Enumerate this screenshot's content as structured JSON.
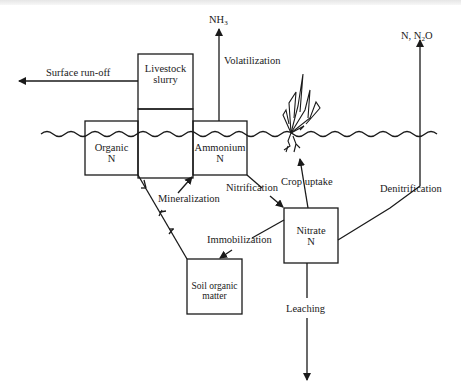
{
  "diagram": {
    "type": "nitrogen-cycle-flow",
    "nodes": {
      "livestock_slurry": {
        "line1": "Livestock",
        "line2": "slurry"
      },
      "organic_n": {
        "line1": "Organic",
        "line2": "N"
      },
      "ammonium_n": {
        "line1": "Ammonium",
        "line2": "N"
      },
      "nitrate_n": {
        "line1": "Nitrate",
        "line2": "N"
      },
      "soil_organic_matter": {
        "line1": "Soil organic",
        "line2": "matter"
      }
    },
    "outputs": {
      "nh3": {
        "base": "NH",
        "sub": "3"
      },
      "n_n2o": {
        "prefix": "N, N",
        "sub": "2",
        "suffix": "O"
      }
    },
    "processes": {
      "surface_runoff": "Surface run-off",
      "volatilization": "Volatilization",
      "mineralization": "Mineralization",
      "nitrification": "Nitrification",
      "crop_uptake": "Crop uptake",
      "denitrification": "Denitrification",
      "immobilization": "Immobilization",
      "leaching": "Leaching"
    },
    "edges": [
      {
        "from": "livestock_slurry",
        "to": "surface_runoff",
        "label": "Surface run-off"
      },
      {
        "from": "ammonium_n",
        "to": "nh3",
        "label": "Volatilization"
      },
      {
        "from": "organic_n",
        "to": "soil_organic_matter",
        "label": ""
      },
      {
        "from": "soil_organic_matter",
        "to": "ammonium_n",
        "label": "Mineralization"
      },
      {
        "from": "ammonium_n",
        "to": "nitrate_n",
        "label": "Nitrification"
      },
      {
        "from": "nitrate_n",
        "to": "crop",
        "label": "Crop uptake"
      },
      {
        "from": "nitrate_n",
        "to": "n_n2o",
        "label": "Denitrification"
      },
      {
        "from": "nitrate_n",
        "to": "soil_organic_matter",
        "label": "Immobilization"
      },
      {
        "from": "nitrate_n",
        "to": "groundwater",
        "label": "Leaching"
      }
    ]
  }
}
